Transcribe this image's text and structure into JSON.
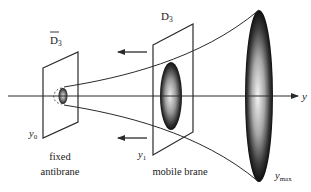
{
  "diagram": {
    "axis": {
      "label": "y"
    },
    "antibrane": {
      "symbol": "D",
      "subscript": "3",
      "overbar": true,
      "position_label": "y",
      "position_sub": "0",
      "caption_line1": "fixed",
      "caption_line2": "antibrane"
    },
    "mobile_brane": {
      "symbol": "D",
      "subscript": "3",
      "position_label": "y",
      "position_sub": "1",
      "caption": "mobile brane"
    },
    "throat_end": {
      "position_label": "y",
      "position_sub": "max"
    },
    "arrows": [
      {
        "direction": "left",
        "meaning": "motion of mobile brane toward antibrane"
      },
      {
        "direction": "left",
        "meaning": "motion of mobile brane toward antibrane"
      }
    ],
    "colors": {
      "line": "#2a2a2a",
      "ellipse_dark": "#111111",
      "ellipse_light": "#f2f2f2",
      "background": "#ffffff"
    }
  }
}
